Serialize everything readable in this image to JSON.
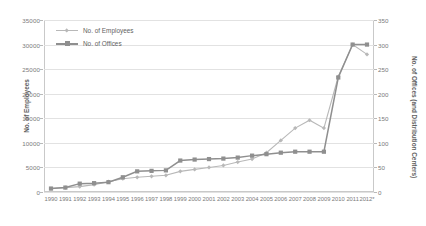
{
  "chart_data": {
    "type": "line",
    "title": "",
    "xlabel": "",
    "ylabel": "No. of Employees",
    "y2label": "No. of Offices (and Distribution Centers)",
    "grid": true,
    "legend_position": "top-left",
    "categories": [
      "1990",
      "1991",
      "1992",
      "1993",
      "1994",
      "1995",
      "1996",
      "1997",
      "1998",
      "1999",
      "2000",
      "2001",
      "2002",
      "2003",
      "2004",
      "2005",
      "2006",
      "2007",
      "2008",
      "2009",
      "2010",
      "2011",
      "2012*"
    ],
    "ylim": [
      0,
      35000
    ],
    "yticks": [
      0,
      5000,
      10000,
      15000,
      20000,
      25000,
      30000,
      35000
    ],
    "y2lim": [
      0,
      350
    ],
    "y2ticks": [
      0,
      50,
      100,
      150,
      200,
      250,
      300,
      350
    ],
    "series": [
      {
        "name": "No. of Employees",
        "axis": "left",
        "color": "#b8b8b8",
        "marker": "diamond",
        "values": [
          700,
          900,
          1100,
          1500,
          2100,
          2700,
          3000,
          3200,
          3400,
          4200,
          4600,
          5000,
          5400,
          6100,
          6700,
          8000,
          10500,
          13000,
          14600,
          13000,
          23500,
          30000,
          28000
        ]
      },
      {
        "name": "No. of Offices",
        "axis": "right",
        "color": "#8f8f8f",
        "marker": "square",
        "values": [
          7,
          9,
          17,
          18,
          20,
          30,
          42,
          43,
          44,
          64,
          66,
          67,
          68,
          70,
          74,
          77,
          80,
          82,
          82,
          82,
          233,
          300,
          300
        ]
      }
    ]
  },
  "legend": {
    "entries": [
      {
        "label": "No. of Employees"
      },
      {
        "label": "No. of Offices"
      }
    ]
  }
}
